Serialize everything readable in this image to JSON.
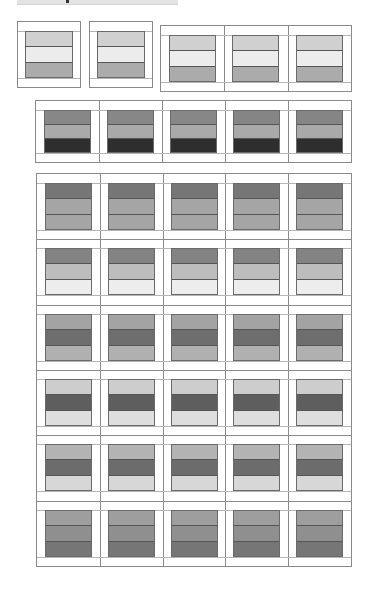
{
  "diagram": {
    "colors": {
      "sashing": "#ffffff",
      "outline": "#8a8a8a",
      "light": "#ececec",
      "light_mid": "#d2d2d2",
      "mid": "#adadad",
      "mid_dark": "#939393",
      "dark": "#767676",
      "darker": "#6b6b6b",
      "darkest": "#2e2e2e"
    },
    "groups": [
      {
        "id": "single-block-1",
        "x": 17,
        "y": 21,
        "w": 64,
        "h": 67,
        "cols": 1,
        "rows": 1,
        "blocks": [
          [
            [
              "#d0d0d0",
              "#ececec",
              "#ababab"
            ]
          ]
        ]
      },
      {
        "id": "single-block-2",
        "x": 89,
        "y": 21,
        "w": 64,
        "h": 67,
        "cols": 1,
        "rows": 1,
        "blocks": [
          [
            [
              "#d0d0d0",
              "#ececec",
              "#ababab"
            ]
          ]
        ]
      },
      {
        "id": "three-block-row",
        "x": 160,
        "y": 25,
        "w": 192,
        "h": 67,
        "cols": 3,
        "rows": 1,
        "blocks": [
          [
            [
              "#d0d0d0",
              "#ececec",
              "#ababab"
            ],
            [
              "#d0d0d0",
              "#ececec",
              "#ababab"
            ],
            [
              "#d0d0d0",
              "#ececec",
              "#ababab"
            ]
          ]
        ]
      },
      {
        "id": "five-block-row",
        "x": 35,
        "y": 100,
        "w": 317,
        "h": 63,
        "cols": 5,
        "rows": 1,
        "blocks": [
          [
            [
              "#878787",
              "#a9a9a9",
              "#2e2e2e"
            ],
            [
              "#878787",
              "#a9a9a9",
              "#2e2e2e"
            ],
            [
              "#878787",
              "#a9a9a9",
              "#2e2e2e"
            ],
            [
              "#858585",
              "#a9a9a9",
              "#2e2e2e"
            ],
            [
              "#858585",
              "#a9a9a9",
              "#2e2e2e"
            ]
          ]
        ]
      },
      {
        "id": "grid-5x6",
        "x": 36,
        "y": 173,
        "w": 316,
        "h": 394,
        "cols": 5,
        "rows": 6,
        "blocks": [
          [
            [
              "#767676",
              "#a5a5a5",
              "#a5a5a5"
            ],
            [
              "#767676",
              "#a5a5a5",
              "#a5a5a5"
            ],
            [
              "#767676",
              "#a5a5a5",
              "#a5a5a5"
            ],
            [
              "#767676",
              "#a5a5a5",
              "#a5a5a5"
            ],
            [
              "#767676",
              "#a5a5a5",
              "#a5a5a5"
            ]
          ],
          [
            [
              "#838383",
              "#bdbdbd",
              "#ededed"
            ],
            [
              "#838383",
              "#bdbdbd",
              "#ededed"
            ],
            [
              "#838383",
              "#bdbdbd",
              "#ededed"
            ],
            [
              "#838383",
              "#bdbdbd",
              "#ededed"
            ],
            [
              "#838383",
              "#bdbdbd",
              "#ededed"
            ]
          ],
          [
            [
              "#a3a3a3",
              "#6e6e6e",
              "#b0b0b0"
            ],
            [
              "#a3a3a3",
              "#6e6e6e",
              "#b0b0b0"
            ],
            [
              "#a3a3a3",
              "#6e6e6e",
              "#b0b0b0"
            ],
            [
              "#a3a3a3",
              "#6e6e6e",
              "#b0b0b0"
            ],
            [
              "#a3a3a3",
              "#6e6e6e",
              "#b0b0b0"
            ]
          ],
          [
            [
              "#cdcdcd",
              "#5e5e5e",
              "#dedede"
            ],
            [
              "#cdcdcd",
              "#5e5e5e",
              "#dedede"
            ],
            [
              "#cdcdcd",
              "#5e5e5e",
              "#dedede"
            ],
            [
              "#cdcdcd",
              "#5e5e5e",
              "#dedede"
            ],
            [
              "#cdcdcd",
              "#5e5e5e",
              "#dedede"
            ]
          ],
          [
            [
              "#b3b3b3",
              "#6c6c6c",
              "#d7d7d7"
            ],
            [
              "#b3b3b3",
              "#6c6c6c",
              "#d7d7d7"
            ],
            [
              "#b3b3b3",
              "#6c6c6c",
              "#d7d7d7"
            ],
            [
              "#b3b3b3",
              "#6c6c6c",
              "#d7d7d7"
            ],
            [
              "#b3b3b3",
              "#6c6c6c",
              "#d7d7d7"
            ]
          ],
          [
            [
              "#9e9e9e",
              "#8f8f8f",
              "#767676"
            ],
            [
              "#9e9e9e",
              "#8f8f8f",
              "#767676"
            ],
            [
              "#9e9e9e",
              "#8f8f8f",
              "#767676"
            ],
            [
              "#9e9e9e",
              "#8f8f8f",
              "#767676"
            ],
            [
              "#9e9e9e",
              "#8f8f8f",
              "#767676"
            ]
          ]
        ]
      }
    ]
  }
}
